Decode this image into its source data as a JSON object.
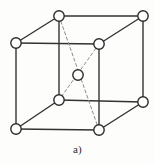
{
  "figure": {
    "caption": "a)",
    "background_color": "#fdfdfb",
    "edge_color": "#333333",
    "diagonal_color": "#8c8c8c",
    "atom_fill_color": "#ffffff",
    "atom_stroke_color": "#2b2b2b",
    "edge_width": 1.4,
    "diagonal_width": 1.0,
    "diagonal_dash": "3,2.6",
    "atom_radius": 5.2,
    "atoms": [
      {
        "id": "top-back-left",
        "label": "corner atom top back left",
        "x": 59,
        "y": 16
      },
      {
        "id": "top-back-right",
        "label": "corner atom top back right",
        "x": 143,
        "y": 16
      },
      {
        "id": "top-front-left",
        "label": "corner atom top front left",
        "x": 16,
        "y": 43
      },
      {
        "id": "top-front-right",
        "label": "corner atom top front right",
        "x": 99,
        "y": 44
      },
      {
        "id": "body-center",
        "label": "body center atom",
        "x": 78,
        "y": 75
      },
      {
        "id": "bottom-back-left",
        "label": "corner atom bottom back left",
        "x": 59,
        "y": 100
      },
      {
        "id": "bottom-back-right",
        "label": "corner atom bottom back right",
        "x": 143,
        "y": 102
      },
      {
        "id": "bottom-front-left",
        "label": "corner atom bottom front left",
        "x": 16,
        "y": 129
      },
      {
        "id": "bottom-front-right",
        "label": "corner atom bottom front right",
        "x": 99,
        "y": 130
      }
    ],
    "edges": [
      {
        "id": "edge-top-back",
        "from": "top-back-left",
        "to": "top-back-right"
      },
      {
        "id": "edge-top-left",
        "from": "top-front-left",
        "to": "top-back-left"
      },
      {
        "id": "edge-top-front",
        "from": "top-front-left",
        "to": "top-front-right"
      },
      {
        "id": "edge-top-right",
        "from": "top-front-right",
        "to": "top-back-right"
      },
      {
        "id": "edge-vert-back-left",
        "from": "top-back-left",
        "to": "bottom-back-left"
      },
      {
        "id": "edge-vert-back-right",
        "from": "top-back-right",
        "to": "bottom-back-right"
      },
      {
        "id": "edge-vert-front-left",
        "from": "top-front-left",
        "to": "bottom-front-left"
      },
      {
        "id": "edge-vert-front-right",
        "from": "top-front-right",
        "to": "bottom-front-right"
      },
      {
        "id": "edge-bottom-back",
        "from": "bottom-back-left",
        "to": "bottom-back-right"
      },
      {
        "id": "edge-bottom-left",
        "from": "bottom-front-left",
        "to": "bottom-back-left"
      },
      {
        "id": "edge-bottom-front",
        "from": "bottom-front-left",
        "to": "bottom-front-right"
      },
      {
        "id": "edge-bottom-right",
        "from": "bottom-front-right",
        "to": "bottom-back-right"
      }
    ],
    "diagonals": [
      {
        "id": "diagonal-a",
        "from": "top-back-left",
        "to": "bottom-front-right"
      },
      {
        "id": "diagonal-b",
        "from": "top-front-right",
        "to": "bottom-back-left"
      }
    ]
  }
}
